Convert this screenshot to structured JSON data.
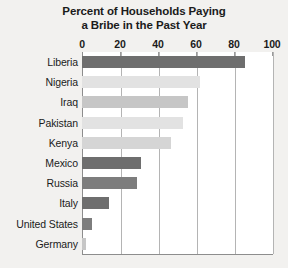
{
  "chart_data": {
    "type": "bar",
    "orientation": "horizontal",
    "title": "Percent of Households Paying a Bribe in the Past Year",
    "title_lines": [
      "Percent of Households Paying",
      "a Bribe in the Past Year"
    ],
    "xlabel": "",
    "ylabel": "",
    "xlim": [
      0,
      100
    ],
    "xticks": [
      0,
      20,
      40,
      60,
      80,
      100
    ],
    "xtick_labels": [
      "0",
      "20",
      "40",
      "60",
      "80",
      "100"
    ],
    "grid": true,
    "grid_axis": "x",
    "legend": false,
    "categories": [
      "Liberia",
      "Nigeria",
      "Iraq",
      "Pakistan",
      "Kenya",
      "Mexico",
      "Russia",
      "Italy",
      "United States",
      "Germany"
    ],
    "values": [
      86,
      62,
      56,
      53,
      47,
      31,
      29,
      14,
      5,
      2
    ],
    "bar_colors": [
      "#6e6e6e",
      "#e2e2e2",
      "#c6c6c6",
      "#e2e2e2",
      "#d5d5d5",
      "#6e6e6e",
      "#7d7d7d",
      "#6e6e6e",
      "#7d7d7d",
      "#c6c6c6"
    ],
    "series": [
      {
        "name": "Percent paying a bribe",
        "values": [
          86,
          62,
          56,
          53,
          47,
          31,
          29,
          14,
          5,
          2
        ]
      }
    ]
  },
  "colors": {
    "background": "#f2f1ef",
    "plot_background": "#ffffff",
    "gridline": "#b4b4b4",
    "axis": "#8d8d8d",
    "text": "#1b1b1b",
    "bar_dark": "#6e6e6e",
    "bar_medium": "#c6c6c6",
    "bar_light": "#e2e2e2"
  }
}
